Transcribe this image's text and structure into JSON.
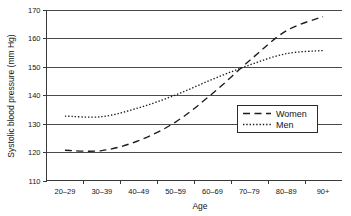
{
  "chart_data": {
    "type": "line",
    "title": "",
    "xlabel": "Age",
    "ylabel": "Systolic blood pressure (mm Hg)",
    "categories": [
      "20–29",
      "30–39",
      "40–49",
      "50–59",
      "60–69",
      "70–79",
      "80–89",
      "90+"
    ],
    "ylim": [
      110,
      170
    ],
    "ytick_labels": [
      "170",
      "160",
      "150",
      "140",
      "130",
      "120",
      "110"
    ],
    "ytick_values": [
      170,
      160,
      150,
      140,
      130,
      120,
      110
    ],
    "grid": true,
    "legend_position": "center-right",
    "series": [
      {
        "name": "Women",
        "style": "dashed",
        "color": "#1c1c1c",
        "values": [
          120.6,
          120.5,
          124.0,
          130.5,
          140.5,
          152.0,
          162.5,
          167.5
        ]
      },
      {
        "name": "Men",
        "style": "dotted",
        "color": "#1c1c1c",
        "values": [
          132.6,
          132.4,
          135.5,
          140.0,
          145.5,
          150.5,
          154.5,
          155.6
        ]
      }
    ]
  },
  "legend": {
    "entries": [
      {
        "label": "Women",
        "style": "dashed"
      },
      {
        "label": "Men",
        "style": "dotted"
      }
    ]
  },
  "axes": {
    "x_title": "Age",
    "y_title": "Systolic blood pressure (mm Hg)"
  }
}
